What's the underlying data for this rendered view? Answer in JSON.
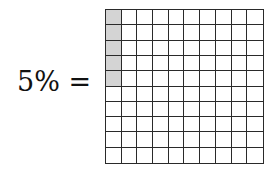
{
  "equation": {
    "label": "5% ="
  },
  "grid": {
    "rows": 10,
    "columns": 10,
    "total_cells": 100,
    "shaded_cells": 5,
    "shaded_positions": [
      {
        "row": 0,
        "col": 0
      },
      {
        "row": 1,
        "col": 0
      },
      {
        "row": 2,
        "col": 0
      },
      {
        "row": 3,
        "col": 0
      },
      {
        "row": 4,
        "col": 0
      }
    ],
    "shade_color": "#d4d4d4",
    "line_color": "#2a2a2a",
    "fill_color": "#ffffff"
  }
}
